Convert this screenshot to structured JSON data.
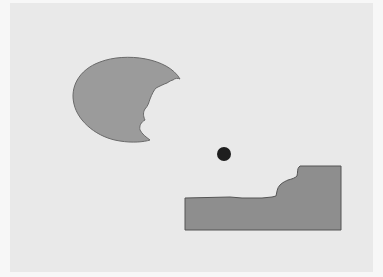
{
  "diagram": {
    "background_color": "#f7f7f7",
    "panel_color": "#e9e9e9",
    "shapes": [
      {
        "id": "bitten-ellipse",
        "type": "ellipse-with-bite",
        "fill": "#9b9b9b",
        "stroke": "#6a6a6a",
        "center": [
          127,
          100
        ],
        "radii": [
          54,
          41
        ]
      },
      {
        "id": "dot",
        "type": "circle",
        "fill": "#1e1e1e",
        "center": [
          224,
          154
        ],
        "radius": 7
      },
      {
        "id": "bitten-rectangle",
        "type": "rectangle-with-bite",
        "fill": "#8e8e8e",
        "stroke": "#555555",
        "bounds": [
          185,
          166,
          341,
          230
        ]
      }
    ]
  }
}
